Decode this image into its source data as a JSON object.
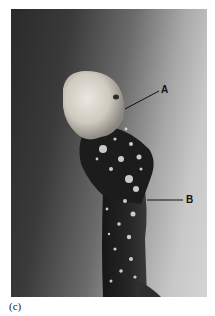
{
  "figure": {
    "caption": "(c)",
    "labels": [
      {
        "id": "A",
        "text": "A"
      },
      {
        "id": "B",
        "text": "B"
      }
    ],
    "colors": {
      "background_dark": "#2a2a2a",
      "background_light": "#d4d4d4",
      "tip": "#d8d4cc",
      "stalk": "#1e1e1e",
      "label": "#111111"
    }
  }
}
